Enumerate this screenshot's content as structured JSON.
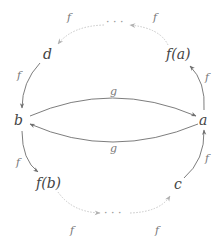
{
  "diagram": {
    "type": "commutative-diagram",
    "colors": {
      "solid_arrow": "#6e6e6e",
      "dotted_arrow": "#c8c8c8",
      "text": "#444444",
      "edge_label": "#777777"
    },
    "nodes": [
      {
        "id": "b",
        "label": "b"
      },
      {
        "id": "a",
        "label": "a"
      },
      {
        "id": "d",
        "label": "d"
      },
      {
        "id": "fa",
        "label": "f(a)"
      },
      {
        "id": "fb",
        "label": "f(b)"
      },
      {
        "id": "c",
        "label": "c"
      },
      {
        "id": "top_dots",
        "label": "· · ·"
      },
      {
        "id": "bottom_dots",
        "label": "· · ·"
      }
    ],
    "edges": [
      {
        "from": "b",
        "to": "a",
        "label": "g",
        "style": "solid"
      },
      {
        "from": "a",
        "to": "b",
        "label": "g",
        "style": "solid"
      },
      {
        "from": "a",
        "to": "fa",
        "label": "f",
        "style": "solid"
      },
      {
        "from": "fa",
        "to": "top_dots",
        "label": "f",
        "style": "dotted"
      },
      {
        "from": "top_dots",
        "to": "d",
        "label": "f",
        "style": "dotted"
      },
      {
        "from": "d",
        "to": "b",
        "label": "f",
        "style": "solid"
      },
      {
        "from": "b",
        "to": "fb",
        "label": "f",
        "style": "solid"
      },
      {
        "from": "fb",
        "to": "bottom_dots",
        "label": "f",
        "style": "dotted"
      },
      {
        "from": "bottom_dots",
        "to": "c",
        "label": "f",
        "style": "dotted"
      },
      {
        "from": "c",
        "to": "a",
        "label": "f",
        "style": "solid"
      }
    ]
  }
}
